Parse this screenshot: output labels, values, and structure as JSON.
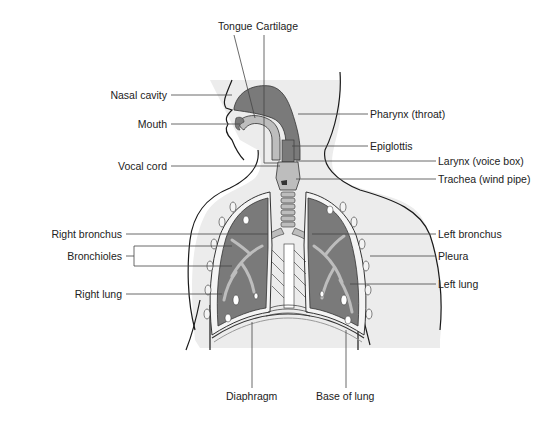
{
  "diagram": {
    "type": "labeled anatomical illustration",
    "colors": {
      "body_fill": "#ececec",
      "organ_fill": "#7a7a7a",
      "airway_light": "#bdbdbd",
      "outline": "#1a1a1a",
      "leader_line": "#444444",
      "text": "#222222"
    },
    "labels": {
      "top": [
        {
          "id": "tongue",
          "text": "Tongue"
        },
        {
          "id": "cartilage",
          "text": "Cartilage"
        }
      ],
      "left": [
        {
          "id": "nasal_cavity",
          "text": "Nasal cavity"
        },
        {
          "id": "mouth",
          "text": "Mouth"
        },
        {
          "id": "vocal_cord",
          "text": "Vocal cord"
        },
        {
          "id": "right_bronchus",
          "text": "Right bronchus"
        },
        {
          "id": "bronchioles",
          "text": "Bronchioles"
        },
        {
          "id": "right_lung",
          "text": "Right lung"
        }
      ],
      "right": [
        {
          "id": "pharynx",
          "text": "Pharynx (throat)"
        },
        {
          "id": "epiglottis",
          "text": "Epiglottis"
        },
        {
          "id": "larynx",
          "text": "Larynx (voice box)"
        },
        {
          "id": "trachea",
          "text": "Trachea (wind pipe)"
        },
        {
          "id": "left_bronchus",
          "text": "Left bronchus"
        },
        {
          "id": "pleura",
          "text": "Pleura"
        },
        {
          "id": "left_lung",
          "text": "Left lung"
        }
      ],
      "bottom": [
        {
          "id": "diaphragm",
          "text": "Diaphragm"
        },
        {
          "id": "base_of_lung",
          "text": "Base of lung"
        }
      ]
    }
  }
}
